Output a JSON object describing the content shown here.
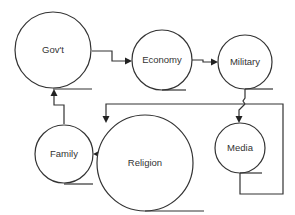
{
  "diagram": {
    "nodes": [
      {
        "id": "govt",
        "label": "Gov't"
      },
      {
        "id": "economy",
        "label": "Economy"
      },
      {
        "id": "military",
        "label": "Military"
      },
      {
        "id": "religion",
        "label": "Religion"
      },
      {
        "id": "family",
        "label": "Family"
      },
      {
        "id": "media",
        "label": "Media"
      }
    ],
    "edges": [
      {
        "from": "govt",
        "to": "economy"
      },
      {
        "from": "economy",
        "to": "military"
      },
      {
        "from": "military",
        "to": "religion"
      },
      {
        "from": "military",
        "to": "media"
      },
      {
        "from": "media",
        "to": "religion"
      },
      {
        "from": "religion",
        "to": "family"
      },
      {
        "from": "family",
        "to": "govt"
      }
    ],
    "colors": {
      "stroke": "#333333",
      "background": "#ffffff"
    }
  }
}
